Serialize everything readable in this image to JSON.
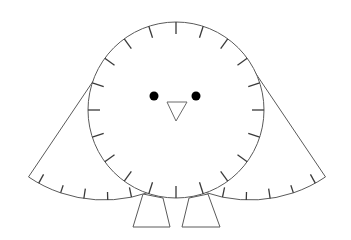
{
  "figure": {
    "colors": {
      "background": "#ffffff",
      "outline": "#5a5a5a",
      "tick": "#3a3a3a",
      "eye": "#000000"
    },
    "body": {
      "cx": 176,
      "cy": 110,
      "r": 88,
      "tick_count": 20,
      "tick_length": 12
    },
    "eyes": [
      {
        "cx": 154,
        "cy": 96,
        "r": 4.5
      },
      {
        "cx": 196,
        "cy": 96,
        "r": 4.5
      }
    ],
    "beak": {
      "points": "167,102 187,102 176,121"
    },
    "left_wing": {
      "apex": [
        104,
        65
      ],
      "r": 135,
      "start_deg": 124,
      "end_deg": 63,
      "tick_count": 6
    },
    "right_wing": {
      "apex": [
        250,
        65
      ],
      "r": 135,
      "start_deg": 56,
      "end_deg": 117,
      "tick_count": 6
    },
    "legs": [
      {
        "points": "143,194 163,198 170,227 133,227"
      },
      {
        "points": "189,198 208,194 220,227 182,227"
      }
    ]
  }
}
